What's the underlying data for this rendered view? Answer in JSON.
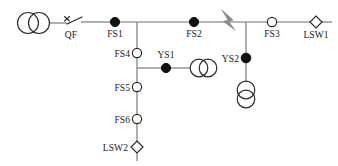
{
  "diagram": {
    "type": "single-line-diagram",
    "title": "",
    "background_color": "#ffffff",
    "line_color": "#6e6e6e",
    "label_color": "#1a1a1a",
    "fault_color": "#8c8c8c",
    "node_fill_closed": "#111111",
    "node_fill_open": "#ffffff"
  },
  "labels": {
    "qf": "QF",
    "fs1": "FS1",
    "fs2": "FS2",
    "fs3": "FS3",
    "fs4": "FS4",
    "fs5": "FS5",
    "fs6": "FS6",
    "ys1": "YS1",
    "ys2": "YS2",
    "lsw1": "LSW1",
    "lsw2": "LSW2"
  },
  "components": [
    {
      "id": "source-transformer",
      "name": "source-transformer",
      "symbol": "two-circle-transformer",
      "orientation": "horizontal",
      "x": 33,
      "y": 23,
      "label": ""
    },
    {
      "id": "qf",
      "name": "circuit-breaker-qf",
      "symbol": "open-switch",
      "x": 70,
      "y": 23,
      "label": "QF",
      "state": "open"
    },
    {
      "id": "fs1",
      "name": "switch-fs1",
      "symbol": "filled-circle",
      "x": 115,
      "y": 22,
      "label": "FS1",
      "state": "closed"
    },
    {
      "id": "fs2",
      "name": "switch-fs2",
      "symbol": "filled-circle",
      "x": 194,
      "y": 22,
      "label": "FS2",
      "state": "closed"
    },
    {
      "id": "fault",
      "name": "fault-lightning",
      "symbol": "lightning-bolt",
      "x": 228,
      "y": 22,
      "label": ""
    },
    {
      "id": "fs3",
      "name": "switch-fs3",
      "symbol": "hollow-circle",
      "x": 272,
      "y": 22,
      "label": "FS3",
      "state": "open"
    },
    {
      "id": "lsw1",
      "name": "load-switch-lsw1",
      "symbol": "hollow-diamond",
      "x": 316,
      "y": 22,
      "label": "LSW1",
      "state": "open"
    },
    {
      "id": "fs4",
      "name": "switch-fs4",
      "symbol": "hollow-circle",
      "x": 137,
      "y": 53,
      "label": "FS4",
      "state": "open"
    },
    {
      "id": "ys1",
      "name": "switch-ys1",
      "symbol": "filled-circle",
      "x": 166,
      "y": 68,
      "label": "YS1",
      "state": "closed"
    },
    {
      "id": "ys1-transformer",
      "name": "ys1-transformer",
      "symbol": "two-circle-transformer",
      "orientation": "horizontal",
      "x": 200,
      "y": 68,
      "label": ""
    },
    {
      "id": "fs5",
      "name": "switch-fs5",
      "symbol": "hollow-circle",
      "x": 137,
      "y": 87,
      "label": "FS5",
      "state": "open"
    },
    {
      "id": "fs6",
      "name": "switch-fs6",
      "symbol": "hollow-circle",
      "x": 137,
      "y": 119,
      "label": "FS6",
      "state": "open"
    },
    {
      "id": "lsw2",
      "name": "load-switch-lsw2",
      "symbol": "hollow-diamond",
      "x": 137,
      "y": 147,
      "label": "LSW2",
      "state": "open"
    },
    {
      "id": "ys2",
      "name": "switch-ys2",
      "symbol": "filled-circle",
      "x": 246,
      "y": 58,
      "label": "YS2",
      "state": "closed"
    },
    {
      "id": "ys2-transformer",
      "name": "ys2-transformer",
      "symbol": "two-circle-transformer",
      "orientation": "vertical",
      "x": 246,
      "y": 94,
      "label": ""
    }
  ],
  "connections": [
    {
      "name": "main-feeder",
      "from": "source-transformer",
      "to": "lsw1"
    },
    {
      "name": "fs1-branch",
      "from": "fs1-tap",
      "to": "lsw2"
    },
    {
      "name": "ys1-branch",
      "from": "fs4-tap",
      "to": "ys1-transformer"
    },
    {
      "name": "ys2-branch",
      "from": "fault-tap",
      "to": "ys2-transformer"
    }
  ]
}
